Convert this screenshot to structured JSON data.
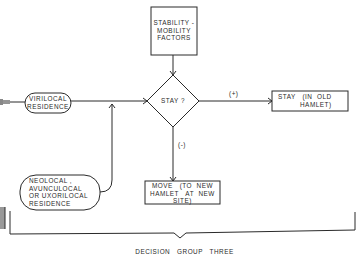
{
  "diagram": {
    "nodes": {
      "stability_mobility": {
        "label_line1": "STABILITY -",
        "label_line2": "MOBILITY",
        "label_line3": "FACTORS",
        "shape": "rectangle"
      },
      "stay_decision": {
        "label": "STAY ?",
        "shape": "diamond"
      },
      "virilocal": {
        "label_line1": "VIRILOCAL",
        "label_line2": "RESIDENCE",
        "shape": "rounded-pill"
      },
      "neolocal": {
        "label_line1": "NEOLOCAL ,",
        "label_line2": "AVUNCULOCAL",
        "label_line3": "OR  UXORILOCAL",
        "label_line4": "RESIDENCE",
        "shape": "rounded-pill"
      },
      "stay_old": {
        "label_line1": "STAY   (IN  OLD",
        "label_line2": "HAMLET)",
        "shape": "rectangle"
      },
      "move_new": {
        "label_line1": "MOVE   (TO  NEW",
        "label_line2": "HAMLET   AT  NEW",
        "label_line3": "SITE)",
        "shape": "rectangle"
      }
    },
    "edges": {
      "positive_label": "(+)",
      "negative_label": "(-)"
    },
    "bracket_label": "DECISION   GROUP   THREE",
    "colors": {
      "line": "#2a2a2a",
      "background": "#ffffff"
    }
  }
}
